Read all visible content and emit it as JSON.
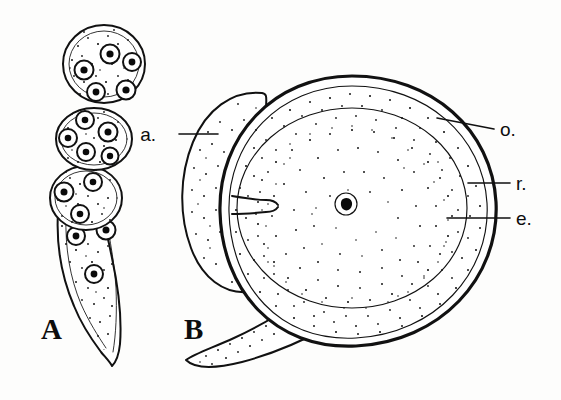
{
  "figure": {
    "kind": "scientific-line-drawing",
    "background_color": "#fdfdfc",
    "ink_color": "#111111",
    "panels": [
      {
        "id": "A",
        "letter": "A",
        "caption_letter": "A",
        "description": "chain of multinucleate cells tapering into a narrow stalk",
        "cell_count": 4,
        "nuclei_visible": 15
      },
      {
        "id": "B",
        "letter": "B",
        "caption_letter": "B",
        "description": "large ovoid body with outer membrane, inner layer, egg cell, central nucleus, lateral lobe and basal stalk",
        "nuclei_visible": 1
      }
    ],
    "labels": [
      {
        "key": "a",
        "text": "a.",
        "x": 156,
        "y": 141,
        "anchor": "end",
        "leader_from_x": 179,
        "leader_from_y": 134,
        "leader_to_x": 216,
        "leader_to_y": 134
      },
      {
        "key": "o",
        "text": "o.",
        "x": 500,
        "y": 136,
        "anchor": "start",
        "leader_from_x": 494,
        "leader_from_y": 129,
        "leader_to_x": 437,
        "leader_to_y": 119
      },
      {
        "key": "r",
        "text": "r.",
        "x": 516,
        "y": 190,
        "anchor": "start",
        "leader_from_x": 510,
        "leader_from_y": 183,
        "leader_to_x": 468,
        "leader_to_y": 183
      },
      {
        "key": "e",
        "text": "e.",
        "x": 516,
        "y": 225,
        "anchor": "start",
        "leader_from_x": 510,
        "leader_from_y": 218,
        "leader_to_x": 447,
        "leader_to_y": 218
      }
    ],
    "panel_letters": [
      {
        "key": "A",
        "text": "A",
        "x": 41,
        "y": 339
      },
      {
        "key": "B",
        "text": "B",
        "x": 184,
        "y": 339
      }
    ],
    "legend_meanings": {
      "a": "a.",
      "o": "o.",
      "r": "r.",
      "e": "e."
    }
  }
}
